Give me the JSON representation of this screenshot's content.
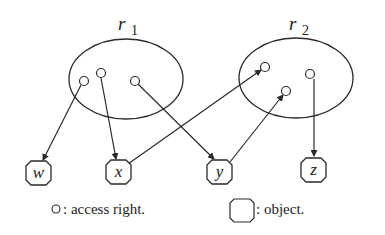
{
  "diagram": {
    "roles": [
      {
        "id": "r1",
        "label": "r",
        "subscript": "1"
      },
      {
        "id": "r2",
        "label": "r",
        "subscript": "2"
      }
    ],
    "objects": [
      {
        "id": "w",
        "label": "w"
      },
      {
        "id": "x",
        "label": "x"
      },
      {
        "id": "y",
        "label": "y"
      },
      {
        "id": "z",
        "label": "z"
      }
    ],
    "edges": [
      {
        "from": "r1.access1",
        "to": "w"
      },
      {
        "from": "r1.access2",
        "to": "x"
      },
      {
        "from": "r1.access3",
        "to": "y"
      },
      {
        "from": "x",
        "to": "r2.access1"
      },
      {
        "from": "y",
        "to": "r2.access2"
      },
      {
        "from": "r2.access3",
        "to": "z"
      }
    ],
    "legend": {
      "access_right": ": access right.",
      "object": ": object."
    }
  },
  "colors": {
    "stroke": "#2a2a2a",
    "background": "#ffffff"
  }
}
